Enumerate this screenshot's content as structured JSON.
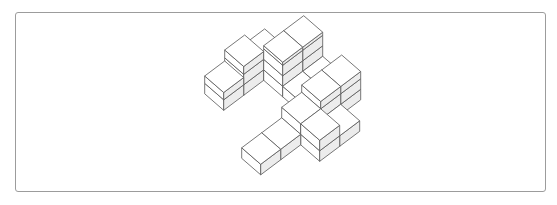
{
  "figure": {
    "type": "isometric-cube-structure",
    "colors": {
      "background": "#ffffff",
      "frame_border": "#9c9c9c",
      "edge": "#555555",
      "top_face": "#ffffff",
      "left_face": "#ffffff",
      "right_face": "#ececec"
    },
    "projection": {
      "origin": [
        241.7,
        158.3
      ],
      "axis_i": [
        19,
        16.5
      ],
      "axis_j": [
        20,
        -15
      ],
      "layer_height": 10.5
    },
    "cubes": [
      {
        "i": -3,
        "j": 3,
        "base": 0,
        "top": 1.9
      },
      {
        "i": -3,
        "j": 2,
        "base": 0,
        "top": 2.74
      },
      {
        "i": -3,
        "j": 1,
        "base": 0,
        "top": 1.7
      },
      {
        "i": -2,
        "j": 4,
        "base": 0,
        "top": 3.3
      },
      {
        "i": -2,
        "j": 3,
        "base": 0,
        "top": 3.3
      },
      {
        "i": -1,
        "j": 3,
        "base": 0,
        "top": 1.0
      },
      {
        "i": -1,
        "j": 4,
        "base": 0,
        "top": 1.0
      },
      {
        "i": 0,
        "j": 4,
        "base": 0,
        "top": 2.7
      },
      {
        "i": 0,
        "j": 3,
        "base": 0,
        "top": 2.7
      },
      {
        "i": 1,
        "j": 3,
        "base": 0,
        "top": 1.0
      },
      {
        "i": 0,
        "j": 2,
        "base": 0,
        "top": 2.0
      },
      {
        "i": 1,
        "j": 2,
        "base": 0,
        "top": 2.0
      },
      {
        "i": 0,
        "j": 1,
        "base": 0,
        "top": 1.0
      },
      {
        "i": 0,
        "j": 0,
        "base": 0,
        "top": 1.0
      }
    ]
  }
}
